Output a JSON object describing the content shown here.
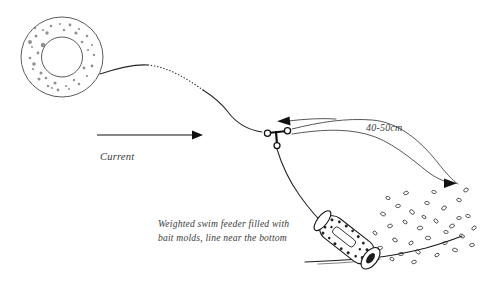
{
  "figure": {
    "title": "Weighted swim feeder rig in current",
    "background_color": "#ffffff",
    "ink_color": "#262626",
    "width": 485,
    "height": 286
  },
  "labels": {
    "current": "Current",
    "distance": "40-50cm",
    "caption_line1": "Weighted swim feeder filled with",
    "caption_line2": "bait molds, line near the bottom"
  },
  "components": {
    "spool": "line-spool",
    "main_line": "main-fishing-line",
    "dotted_segment": "dotted-line-segment",
    "swivel": "three-way-swivel",
    "hooklength": "hooklength-line",
    "feeder": "weighted-swim-feeder",
    "riverbed": "riverbed-line",
    "bait_trail": "bait-particle-trail"
  },
  "arrows": {
    "current_direction": "right",
    "flow_upper": "left",
    "flow_lower": "right"
  }
}
